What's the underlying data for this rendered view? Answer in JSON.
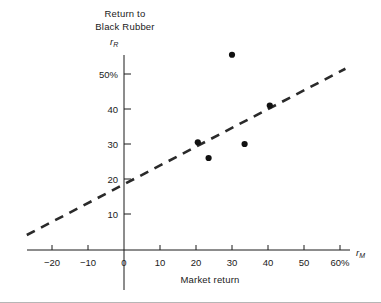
{
  "chart_data": {
    "type": "scatter",
    "title": "Return to Black Rubber",
    "title_lines": [
      "Return to",
      "Black Rubber"
    ],
    "xlabel": "Market return",
    "ylabel": "Return to Black Rubber",
    "x_symbol": "r",
    "x_symbol_sub": "M",
    "y_symbol": "r",
    "y_symbol_sub": "R",
    "xlim": [
      -25,
      65
    ],
    "ylim": [
      0,
      57
    ],
    "grid": false,
    "legend": null,
    "x_ticks": [
      {
        "value": -20,
        "label": "−20"
      },
      {
        "value": -10,
        "label": "−10"
      },
      {
        "value": 0,
        "label": "0"
      },
      {
        "value": 10,
        "label": "10"
      },
      {
        "value": 20,
        "label": "20"
      },
      {
        "value": 30,
        "label": "30"
      },
      {
        "value": 40,
        "label": "40"
      },
      {
        "value": 50,
        "label": "50"
      },
      {
        "value": 60,
        "label": "60%"
      }
    ],
    "y_ticks": [
      {
        "value": 10,
        "label": "10"
      },
      {
        "value": 20,
        "label": "20"
      },
      {
        "value": 30,
        "label": "30"
      },
      {
        "value": 40,
        "label": "40"
      },
      {
        "value": 50,
        "label": "50%"
      }
    ],
    "points": [
      {
        "x": 30.0,
        "y": 55.5
      },
      {
        "x": 20.5,
        "y": 30.5
      },
      {
        "x": 23.5,
        "y": 26.0
      },
      {
        "x": 33.5,
        "y": 30.0
      },
      {
        "x": 40.5,
        "y": 41.0
      }
    ],
    "fit_line": {
      "style": "dashed",
      "x_start": -27.0,
      "y_start": 4.0,
      "x_end": 61.5,
      "y_end": 51.5,
      "intercept": 18.5,
      "slope": 0.54
    }
  }
}
